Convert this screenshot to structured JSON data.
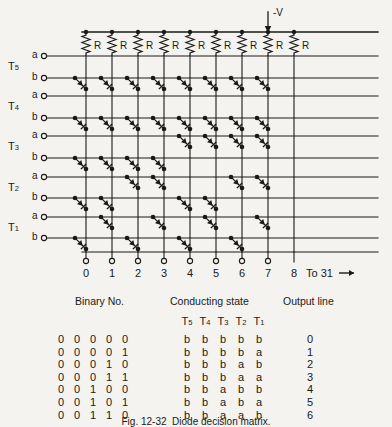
{
  "figure": {
    "supply_label": "-V",
    "resistor_label": "R",
    "stage_labels": [
      "T5",
      "T4",
      "T3",
      "T2",
      "T1"
    ],
    "stage_label_text": [
      "T",
      "T",
      "T",
      "T",
      "T"
    ],
    "stage_subscripts": [
      "5",
      "4",
      "3",
      "2",
      "1"
    ],
    "input_line_labels": [
      "a",
      "b"
    ],
    "output_column_numbers": [
      "0",
      "1",
      "2",
      "3",
      "4",
      "5",
      "6",
      "7",
      "8"
    ],
    "continuation_label": "To 31",
    "continuation_arrow": "→",
    "resistor_count": 9,
    "caption": "Fig. 12-32  Diode decision matrix."
  },
  "table": {
    "headers": {
      "binary": "Binary No.",
      "conducting": "Conducting state",
      "output": "Output line"
    },
    "state_columns": [
      "T5",
      "T4",
      "T3",
      "T2",
      "T1"
    ],
    "state_column_base": [
      "T",
      "T",
      "T",
      "T",
      "T"
    ],
    "state_column_sub": [
      "5",
      "4",
      "3",
      "2",
      "1"
    ],
    "rows": [
      {
        "binary": [
          "0",
          "0",
          "0",
          "0",
          "0"
        ],
        "state": [
          "b",
          "b",
          "b",
          "b",
          "b"
        ],
        "output": "0"
      },
      {
        "binary": [
          "0",
          "0",
          "0",
          "0",
          "1"
        ],
        "state": [
          "b",
          "b",
          "b",
          "b",
          "a"
        ],
        "output": "1"
      },
      {
        "binary": [
          "0",
          "0",
          "0",
          "1",
          "0"
        ],
        "state": [
          "b",
          "b",
          "b",
          "a",
          "b"
        ],
        "output": "2"
      },
      {
        "binary": [
          "0",
          "0",
          "0",
          "1",
          "1"
        ],
        "state": [
          "b",
          "b",
          "b",
          "a",
          "a"
        ],
        "output": "3"
      },
      {
        "binary": [
          "0",
          "0",
          "1",
          "0",
          "0"
        ],
        "state": [
          "b",
          "b",
          "a",
          "b",
          "b"
        ],
        "output": "4"
      },
      {
        "binary": [
          "0",
          "0",
          "1",
          "0",
          "1"
        ],
        "state": [
          "b",
          "b",
          "a",
          "b",
          "a"
        ],
        "output": "5"
      },
      {
        "binary": [
          "0",
          "0",
          "1",
          "1",
          "0"
        ],
        "state": [
          "b",
          "b",
          "a",
          "a",
          "b"
        ],
        "output": "6"
      }
    ]
  },
  "geometry": {
    "column_x": [
      86,
      112,
      138,
      164,
      190,
      216,
      242,
      268,
      294
    ],
    "row_y": [
      56,
      78,
      96,
      118,
      136,
      158,
      177,
      198,
      217,
      238
    ],
    "bus_y": 32,
    "terminal_x": 44,
    "line_right": 378,
    "bottom_y": 252,
    "supply_x": 268
  },
  "colors": {
    "ink": "#1a1a1a",
    "paper": "#f4f3ef"
  }
}
